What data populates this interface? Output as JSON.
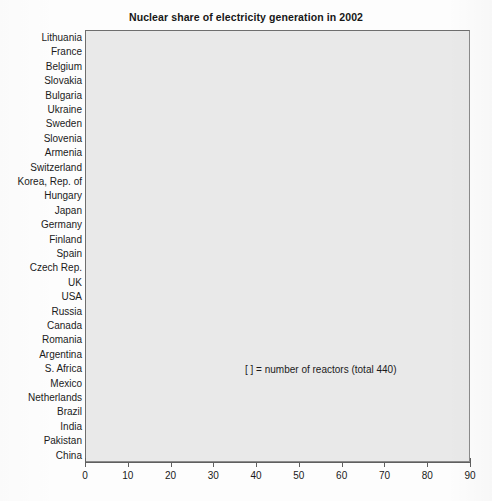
{
  "chart_data": {
    "type": "bar",
    "orientation": "horizontal",
    "title": "Nuclear share of electricity generation in 2002",
    "xlabel": "",
    "ylabel": "",
    "xlim": [
      0,
      90
    ],
    "xticks": [
      0,
      10,
      20,
      30,
      40,
      50,
      60,
      70,
      80,
      90
    ],
    "grid": false,
    "legend": null,
    "annotation": "[ ]  = number of reactors (total 440)",
    "value_label_format": "{value}  [{reactors}]",
    "categories": [
      "Lithuania",
      "France",
      "Belgium",
      "Slovakia",
      "Bulgaria",
      "Ukraine",
      "Sweden",
      "Slovenia",
      "Armenia",
      "Switzerland",
      "Korea, Rep. of",
      "Hungary",
      "Japan",
      "Germany",
      "Finland",
      "Spain",
      "Czech Rep.",
      "UK",
      "USA",
      "Russia",
      "Canada",
      "Romania",
      "Argentina",
      "S. Africa",
      "Mexico",
      "Netherlands",
      "Brazil",
      "India",
      "Pakistan",
      "China"
    ],
    "values": [
      80,
      78,
      57,
      55,
      47,
      46,
      46,
      41,
      41,
      40,
      39,
      36,
      35,
      30,
      30,
      26,
      25,
      22,
      20,
      16,
      12,
      10,
      7,
      6,
      4,
      4,
      4,
      4,
      3,
      1
    ],
    "reactors": [
      2,
      59,
      7,
      6,
      4,
      13,
      11,
      1,
      1,
      5,
      18,
      4,
      54,
      19,
      4,
      9,
      6,
      27,
      104,
      30,
      16,
      1,
      2,
      2,
      2,
      1,
      2,
      14,
      2,
      8
    ],
    "series": [
      {
        "name": "Nuclear share of electricity generation (%)",
        "values": [
          80,
          78,
          57,
          55,
          47,
          46,
          46,
          41,
          41,
          40,
          39,
          36,
          35,
          30,
          30,
          26,
          25,
          22,
          20,
          16,
          12,
          10,
          7,
          6,
          4,
          4,
          4,
          4,
          3,
          1
        ]
      }
    ],
    "rows": [
      {
        "category": "Lithuania",
        "value": 80,
        "reactors": 2,
        "label": "80  [2]"
      },
      {
        "category": "France",
        "value": 78,
        "reactors": 59,
        "label": "78  [59]"
      },
      {
        "category": "Belgium",
        "value": 57,
        "reactors": 7,
        "label": "57  [7]"
      },
      {
        "category": "Slovakia",
        "value": 55,
        "reactors": 6,
        "label": "55  [6]"
      },
      {
        "category": "Bulgaria",
        "value": 47,
        "reactors": 4,
        "label": "47  [4]"
      },
      {
        "category": "Ukraine",
        "value": 46,
        "reactors": 13,
        "label": "46  [13]"
      },
      {
        "category": "Sweden",
        "value": 46,
        "reactors": 11,
        "label": "46  [11]"
      },
      {
        "category": "Slovenia",
        "value": 41,
        "reactors": 1,
        "label": "41  [1]"
      },
      {
        "category": "Armenia",
        "value": 41,
        "reactors": 1,
        "label": "41  [1]"
      },
      {
        "category": "Switzerland",
        "value": 40,
        "reactors": 5,
        "label": "40  [5]"
      },
      {
        "category": "Korea, Rep. of",
        "value": 39,
        "reactors": 18,
        "label": "39  [18]"
      },
      {
        "category": "Hungary",
        "value": 36,
        "reactors": 4,
        "label": "36  [4]"
      },
      {
        "category": "Japan",
        "value": 35,
        "reactors": 54,
        "label": "35  [54]"
      },
      {
        "category": "Germany",
        "value": 30,
        "reactors": 19,
        "label": "30  [19]"
      },
      {
        "category": "Finland",
        "value": 30,
        "reactors": 4,
        "label": "30  [4]"
      },
      {
        "category": "Spain",
        "value": 26,
        "reactors": 9,
        "label": "26  [9]"
      },
      {
        "category": "Czech Rep.",
        "value": 25,
        "reactors": 6,
        "label": "25  [6]"
      },
      {
        "category": "UK",
        "value": 22,
        "reactors": 27,
        "label": "22  [27]"
      },
      {
        "category": "USA",
        "value": 20,
        "reactors": 104,
        "label": "20  [104]"
      },
      {
        "category": "Russia",
        "value": 16,
        "reactors": 30,
        "label": "16  [30]"
      },
      {
        "category": "Canada",
        "value": 12,
        "reactors": 16,
        "label": "12  [16]"
      },
      {
        "category": "Romania",
        "value": 10,
        "reactors": 1,
        "label": "10  [1]"
      },
      {
        "category": "Argentina",
        "value": 7,
        "reactors": 2,
        "label": "7  [2]"
      },
      {
        "category": "S. Africa",
        "value": 6,
        "reactors": 2,
        "label": "6  [2]"
      },
      {
        "category": "Mexico",
        "value": 4,
        "reactors": 2,
        "label": "4  [2]"
      },
      {
        "category": "Netherlands",
        "value": 4,
        "reactors": 1,
        "label": "4  [1]"
      },
      {
        "category": "Brazil",
        "value": 4,
        "reactors": 2,
        "label": "4  [2]"
      },
      {
        "category": "India",
        "value": 4,
        "reactors": 14,
        "label": "4  [14]"
      },
      {
        "category": "Pakistan",
        "value": 3,
        "reactors": 2,
        "label": "3  [2]"
      },
      {
        "category": "China",
        "value": 1,
        "reactors": 8,
        "label": "1  [8]"
      }
    ],
    "colors": {
      "plot_background": "#e9e9e9",
      "page_background": "#ffffff",
      "bar": "#2a2a2a",
      "axis": "#5f5f5f",
      "text": "#171717",
      "frame": "#6e6e6e"
    }
  }
}
